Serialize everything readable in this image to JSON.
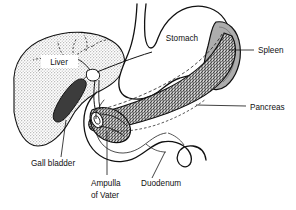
{
  "figure": {
    "background_color": "#ffffff",
    "line_color": "#111111",
    "width": 296,
    "height": 210
  },
  "labels": [
    {
      "id": "liver",
      "text": "Liver",
      "x": 59,
      "y": 63,
      "anchor": "middle",
      "boxed": true,
      "box_fill": "#ffffff",
      "leader": false
    },
    {
      "id": "stomach",
      "text": "Stomach",
      "x": 182,
      "y": 38,
      "anchor": "middle",
      "boxed": false,
      "leader": false
    },
    {
      "id": "spleen",
      "text": "Spleen",
      "x": 258,
      "y": 53,
      "anchor": "start",
      "boxed": false,
      "leader": true,
      "leader_path": "M 229 50 L 254 50"
    },
    {
      "id": "pancreas",
      "text": "Pancreas",
      "x": 250,
      "y": 110,
      "anchor": "start",
      "boxed": false,
      "leader": true,
      "leader_path": "M 196 105 L 246 106"
    },
    {
      "id": "gall-bladder",
      "text": "Gall bladder",
      "x": 31,
      "y": 166,
      "anchor": "start",
      "boxed": false,
      "leader": true,
      "leader_path": "M 66 120 L 61 157"
    },
    {
      "id": "ampulla-of-vater",
      "text": "Ampulla",
      "text_line2": "of Vater",
      "x": 91,
      "y": 185,
      "anchor": "start",
      "boxed": false,
      "leader": true,
      "leader_path": "M 107 131 L 107 175"
    },
    {
      "id": "duodenum",
      "text": "Duodenum",
      "x": 141,
      "y": 186,
      "anchor": "start",
      "boxed": false,
      "leader": true,
      "leader_path": "M 165 152 L 152 178"
    }
  ],
  "organs": {
    "liver": {
      "name": "Liver",
      "fill_style": "light-stipple",
      "fill_color": "#d9d9d9",
      "stroke": "#111111",
      "stroke_width": 1.1
    },
    "stomach": {
      "name": "Stomach",
      "fill_style": "none",
      "fill_color": "#ffffff",
      "stroke": "#111111",
      "stroke_width": 1.3
    },
    "spleen": {
      "name": "Spleen",
      "fill_style": "solid-gray",
      "fill_color": "#adadad",
      "stroke": "#111111",
      "stroke_width": 1.2
    },
    "pancreas": {
      "name": "Pancreas",
      "fill_style": "dense-stipple",
      "fill_color": "#9a9a9a",
      "stroke": "#111111",
      "stroke_width": 1.2
    },
    "gall_bladder": {
      "name": "Gall bladder",
      "fill_style": "solid-dark",
      "fill_color": "#3c3c3c",
      "stroke": "#111111",
      "stroke_width": 1.0
    },
    "duodenum": {
      "name": "Duodenum",
      "fill_style": "none",
      "fill_color": "#ffffff",
      "stroke": "#111111",
      "stroke_width": 1.3
    },
    "bile_duct": {
      "name": "Bile duct",
      "fill_style": "none",
      "stroke": "#111111",
      "stroke_width": 0.9
    }
  }
}
